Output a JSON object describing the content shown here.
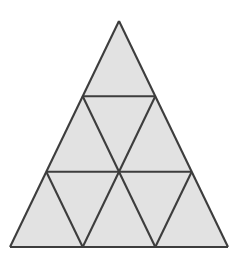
{
  "figure": {
    "title": "Equilateral triangle subdivided into nine smaller triangles",
    "shape_name": "triangle",
    "subdivision_rows": 3,
    "total_small_triangles": 9,
    "upward_triangles": 6,
    "downward_triangles": 3,
    "fill_color": "#e2e2e2",
    "stroke_color": "#3d3d3d",
    "background_color": "#ffffff",
    "stroke_width": 2.1,
    "canvas": {
      "width": 245,
      "height": 264
    },
    "outer_vertices": {
      "apex": {
        "x": 119,
        "y": 21
      },
      "bottom_left": {
        "x": 10,
        "y": 247
      },
      "bottom_right": {
        "x": 228,
        "y": 247
      }
    },
    "row_divider_y": [
      95,
      171,
      247
    ],
    "lattice_points": [
      {
        "id": "p0",
        "x": 119,
        "y": 21
      },
      {
        "id": "p1",
        "x": 82.7,
        "y": 96.3
      },
      {
        "id": "p2",
        "x": 155.3,
        "y": 96.3
      },
      {
        "id": "p3",
        "x": 46.3,
        "y": 171.7
      },
      {
        "id": "p4",
        "x": 119,
        "y": 171.7
      },
      {
        "id": "p5",
        "x": 191.7,
        "y": 171.7
      },
      {
        "id": "p6",
        "x": 10,
        "y": 247
      },
      {
        "id": "p7",
        "x": 82.7,
        "y": 247
      },
      {
        "id": "p8",
        "x": 155.3,
        "y": 247
      },
      {
        "id": "p9",
        "x": 228,
        "y": 247
      }
    ],
    "faces": [
      {
        "name": "triangle-row1-up-1",
        "orientation": "up",
        "points": "119,21 82.7,96.3 155.3,96.3"
      },
      {
        "name": "triangle-row2-up-1",
        "orientation": "up",
        "points": "82.7,96.3 46.3,171.7 119,171.7"
      },
      {
        "name": "triangle-row2-down-1",
        "orientation": "down",
        "points": "82.7,96.3 155.3,96.3 119,171.7"
      },
      {
        "name": "triangle-row2-up-2",
        "orientation": "up",
        "points": "155.3,96.3 119,171.7 191.7,171.7"
      },
      {
        "name": "triangle-row3-up-1",
        "orientation": "up",
        "points": "46.3,171.7 10,247 82.7,247"
      },
      {
        "name": "triangle-row3-down-1",
        "orientation": "down",
        "points": "46.3,171.7 119,171.7 82.7,247"
      },
      {
        "name": "triangle-row3-up-2",
        "orientation": "up",
        "points": "119,171.7 82.7,247 155.3,247"
      },
      {
        "name": "triangle-row3-down-2",
        "orientation": "down",
        "points": "119,171.7 191.7,171.7 155.3,247"
      },
      {
        "name": "triangle-row3-up-3",
        "orientation": "up",
        "points": "191.7,171.7 155.3,247 228,247"
      }
    ],
    "edges": [
      {
        "name": "outer-edge-left",
        "x1": 119,
        "y1": 21,
        "x2": 10,
        "y2": 247
      },
      {
        "name": "outer-edge-right",
        "x1": 119,
        "y1": 21,
        "x2": 228,
        "y2": 247
      },
      {
        "name": "outer-edge-base",
        "x1": 10,
        "y1": 247,
        "x2": 228,
        "y2": 247
      },
      {
        "name": "horizontal-divider-upper",
        "x1": 82.7,
        "y1": 96.3,
        "x2": 155.3,
        "y2": 96.3
      },
      {
        "name": "horizontal-divider-lower",
        "x1": 46.3,
        "y1": 171.7,
        "x2": 191.7,
        "y2": 171.7
      },
      {
        "name": "diagonal-left-to-right-1",
        "x1": 82.7,
        "y1": 96.3,
        "x2": 119,
        "y2": 171.7
      },
      {
        "name": "diagonal-left-to-right-2",
        "x1": 46.3,
        "y1": 171.7,
        "x2": 82.7,
        "y2": 247
      },
      {
        "name": "diagonal-left-to-right-3",
        "x1": 119,
        "y1": 171.7,
        "x2": 155.3,
        "y2": 247
      },
      {
        "name": "diagonal-right-to-left-1",
        "x1": 155.3,
        "y1": 96.3,
        "x2": 119,
        "y2": 171.7
      },
      {
        "name": "diagonal-right-to-left-2",
        "x1": 119,
        "y1": 171.7,
        "x2": 82.7,
        "y2": 247
      },
      {
        "name": "diagonal-right-to-left-3",
        "x1": 191.7,
        "y1": 171.7,
        "x2": 155.3,
        "y2": 247
      }
    ]
  }
}
